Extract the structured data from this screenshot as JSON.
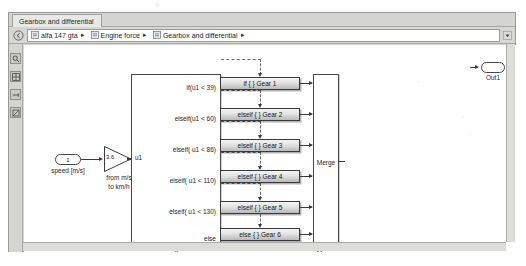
{
  "window": {
    "tab_label": "Gearbox and differential"
  },
  "breadcrumb": {
    "back_icon": "back-arrow-icon",
    "dropdown_icon": "chevron-down-icon",
    "separator": "▸",
    "items": [
      {
        "label": "alfa 147 gta",
        "icon": "model-icon"
      },
      {
        "label": "Engine force",
        "icon": "subsystem-icon"
      },
      {
        "label": "Gearbox and differential",
        "icon": "subsystem-icon"
      }
    ]
  },
  "toolrail": {
    "items": [
      {
        "name": "zoom-tool",
        "icon": "magnifier-icon"
      },
      {
        "name": "fit-to-view-tool",
        "icon": "grid-icon"
      },
      {
        "name": "navigate-tool",
        "icon": "arrow-tool-icon"
      },
      {
        "name": "annotate-tool",
        "icon": "stamp-icon"
      }
    ]
  },
  "diagram": {
    "input_port": {
      "number": "1",
      "label": "speed [m/s]"
    },
    "gain": {
      "value": "3.6",
      "label_line1": "from m/s",
      "label_line2": "to km/h"
    },
    "if_block": {
      "name": "If",
      "input_label": "u1",
      "conditions": [
        "if(u1 < 39)",
        "elseif(u1 < 60)",
        "elseif( u1 < 86)",
        "elseif( u1 < 110)",
        "elseif( u1 < 130)",
        "else"
      ]
    },
    "action_blocks": [
      "if { }     Gear 1",
      "elseif { } Gear 2",
      "elseif { } Gear 3",
      "elseif { } Gear 4",
      "elseif { } Gear 5",
      "else { }   Gear 6"
    ],
    "merge_block": {
      "text": "Merge",
      "label": "Merge"
    },
    "output_port": {
      "label": "Out1"
    }
  }
}
